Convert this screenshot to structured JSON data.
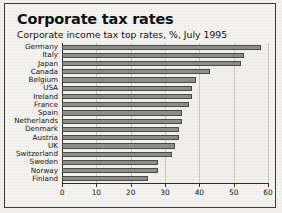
{
  "chart_data": {
    "type": "bar",
    "orientation": "horizontal",
    "title": "Corporate tax rates",
    "subtitle": "Corporate income tax top rates, %, July 1995",
    "xlabel": "",
    "ylabel": "",
    "xlim": [
      0,
      60
    ],
    "xticks": [
      0,
      10,
      20,
      30,
      40,
      50,
      60
    ],
    "grid": true,
    "legend": false,
    "bar_color": "#8d8d8a",
    "bar_edge_color": "#4a4a48",
    "background_color": "#f1f0ec",
    "categories": [
      "Germany",
      "Italy",
      "Japan",
      "Canada",
      "Belgium",
      "USA",
      "Ireland",
      "France",
      "Spain",
      "Netherlands",
      "Denmark",
      "Austria",
      "UK",
      "Switzerland",
      "Sweden",
      "Norway",
      "Finland"
    ],
    "values": [
      58,
      53,
      52,
      43,
      39,
      38,
      38,
      37,
      35,
      35,
      34,
      34,
      33,
      32,
      28,
      28,
      25
    ]
  }
}
